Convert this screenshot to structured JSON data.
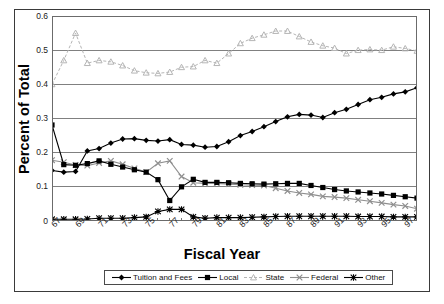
{
  "chart_data": {
    "type": "line",
    "title": "",
    "xlabel": "Fiscal Year",
    "ylabel": "Percent of Total",
    "grid": true,
    "legend_position": "bottom",
    "ylim": [
      0,
      0.6
    ],
    "ytick_labels": [
      "0.6",
      "0.5",
      "0.4",
      "0.3",
      "0.2",
      "0.1",
      "0"
    ],
    "ytick_values": [
      0.6,
      0.5,
      0.4,
      0.3,
      0.2,
      0.1,
      0
    ],
    "x": [
      1967,
      1968,
      1969,
      1970,
      1971,
      1972,
      1973,
      1974,
      1975,
      1976,
      1977,
      1978,
      1979,
      1980,
      1981,
      1982,
      1983,
      1984,
      1985,
      1986,
      1987,
      1988,
      1989,
      1990,
      1991,
      1992,
      1993,
      1994,
      1995,
      1996,
      1997,
      1998
    ],
    "xtick_labels": [
      "67",
      "69",
      "71",
      "73",
      "75",
      "77",
      "79",
      "81",
      "83",
      "85",
      "87",
      "89",
      "91",
      "93",
      "95",
      "97"
    ],
    "xtick_values": [
      1967,
      1969,
      1971,
      1973,
      1975,
      1977,
      1979,
      1981,
      1983,
      1985,
      1987,
      1989,
      1991,
      1993,
      1995,
      1997
    ],
    "series": [
      {
        "name": "Tuition and Fees",
        "marker": "diamond",
        "color": "#000000",
        "line_style": "solid",
        "values": [
          0.148,
          0.143,
          0.145,
          0.205,
          0.212,
          0.228,
          0.24,
          0.241,
          0.236,
          0.234,
          0.238,
          0.224,
          0.222,
          0.216,
          0.218,
          0.232,
          0.25,
          0.262,
          0.276,
          0.291,
          0.305,
          0.312,
          0.31,
          0.303,
          0.317,
          0.327,
          0.341,
          0.355,
          0.362,
          0.372,
          0.378,
          0.39
        ]
      },
      {
        "name": "Local",
        "marker": "square",
        "color": "#000000",
        "line_style": "solid",
        "values": [
          0.281,
          0.165,
          0.163,
          0.168,
          0.176,
          0.166,
          0.158,
          0.15,
          0.143,
          0.121,
          0.06,
          0.1,
          0.122,
          0.113,
          0.113,
          0.112,
          0.11,
          0.109,
          0.108,
          0.109,
          0.11,
          0.11,
          0.104,
          0.098,
          0.092,
          0.088,
          0.085,
          0.082,
          0.079,
          0.075,
          0.071,
          0.067
        ]
      },
      {
        "name": "State",
        "marker": "triangle",
        "color": "#b5b5b5",
        "line_style": "dashed",
        "values": [
          0.4,
          0.47,
          0.55,
          0.462,
          0.47,
          0.466,
          0.455,
          0.44,
          0.434,
          0.432,
          0.436,
          0.45,
          0.452,
          0.47,
          0.462,
          0.49,
          0.52,
          0.535,
          0.545,
          0.556,
          0.556,
          0.54,
          0.524,
          0.513,
          0.506,
          0.49,
          0.5,
          0.502,
          0.5,
          0.51,
          0.505,
          0.498
        ]
      },
      {
        "name": "Federal",
        "marker": "cross",
        "color": "#8f8f8f",
        "line_style": "solid",
        "values": [
          0.178,
          0.172,
          0.164,
          0.162,
          0.17,
          0.176,
          0.166,
          0.154,
          0.143,
          0.169,
          0.176,
          0.13,
          0.112,
          0.11,
          0.11,
          0.108,
          0.106,
          0.105,
          0.104,
          0.096,
          0.088,
          0.082,
          0.078,
          0.072,
          0.07,
          0.067,
          0.062,
          0.058,
          0.053,
          0.048,
          0.044,
          0.036
        ]
      },
      {
        "name": "Other",
        "marker": "star",
        "color": "#000000",
        "line_style": "solid",
        "values": [
          0.005,
          0.005,
          0.005,
          0.006,
          0.008,
          0.008,
          0.008,
          0.01,
          0.012,
          0.028,
          0.034,
          0.034,
          0.012,
          0.008,
          0.01,
          0.01,
          0.01,
          0.011,
          0.012,
          0.013,
          0.014,
          0.014,
          0.014,
          0.014,
          0.014,
          0.014,
          0.013,
          0.013,
          0.013,
          0.012,
          0.012,
          0.012
        ]
      }
    ]
  }
}
